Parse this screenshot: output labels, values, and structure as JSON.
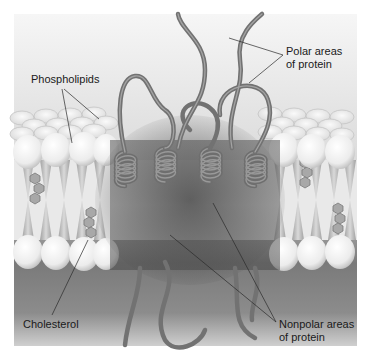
{
  "figure": {
    "labels": {
      "phospholipids": "Phospholipids",
      "polar_line1": "Polar areas",
      "polar_line2": "of protein",
      "cholesterol": "Cholesterol",
      "nonpolar_line1": "Nonpolar areas",
      "nonpolar_line2": "of protein"
    },
    "colors": {
      "background_top": "#f2f2f2",
      "background_bottom": "#6a6a6a",
      "head_fill": "#f4f4f4",
      "tail_fill": "#c8c8c8",
      "protein": "#7a7a7a",
      "text": "#1a1a1a"
    }
  }
}
